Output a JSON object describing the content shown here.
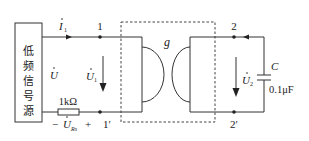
{
  "diagram": {
    "type": "circuit",
    "source": {
      "label_chars": [
        "低",
        "频",
        "信",
        "号",
        "源"
      ],
      "voltage_label": "U",
      "voltage_has_dot": true
    },
    "current": {
      "label": "I",
      "subscript": "1",
      "has_dot": true
    },
    "resistor": {
      "value": "1kΩ",
      "voltage_label": "U",
      "voltage_subscript": "Rs",
      "minus": "−",
      "plus": "+"
    },
    "port1": {
      "top_node": "1",
      "bottom_node": "1′",
      "voltage_label": "U",
      "voltage_subscript": "1"
    },
    "two_port": {
      "label": "g"
    },
    "port2": {
      "top_node": "2",
      "bottom_node": "2′",
      "voltage_label": "U",
      "voltage_subscript": "2"
    },
    "capacitor": {
      "name": "C",
      "value": "0.1μF"
    },
    "colors": {
      "line": "#333333",
      "text": "#222222",
      "background": "#ffffff"
    }
  }
}
